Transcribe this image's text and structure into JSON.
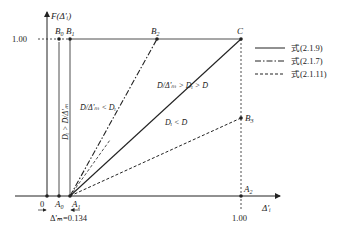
{
  "diagram": {
    "y_axis_label": "F(Δ'ᵢ)",
    "x_axis_label": "Δ'ᵢ",
    "y_tick_label": "1.00",
    "x_tick_label": "1.00",
    "origin_label": "0",
    "points": {
      "B0": "B",
      "B0_sub": "0",
      "B1": "B",
      "B1_sub": "1",
      "B2": "B",
      "B2_sub": "2",
      "B3": "B",
      "B3_sub": "3",
      "C": "C",
      "A0": "A",
      "A0_sub": "0",
      "A1": "A",
      "A1_sub": "1",
      "A2": "A",
      "A2_sub": "2"
    },
    "delta_m_label": "Δ'ₘ=0.134",
    "region_labels": {
      "left_vertical": "Dᵢ > D̄/Δ'ₘ",
      "upper_left": "D̄/Δ'ₘ < Dᵢ",
      "middle": "D̄/Δ'ₘ > Dᵢ > D̄",
      "lower": "Dᵢ < D̄"
    },
    "legend": [
      {
        "style": "solid",
        "label": "式(2.1.9)"
      },
      {
        "style": "dash-dot",
        "label": "式(2.1.7)"
      },
      {
        "style": "dashed",
        "label": "式(2.1.11)"
      }
    ]
  }
}
